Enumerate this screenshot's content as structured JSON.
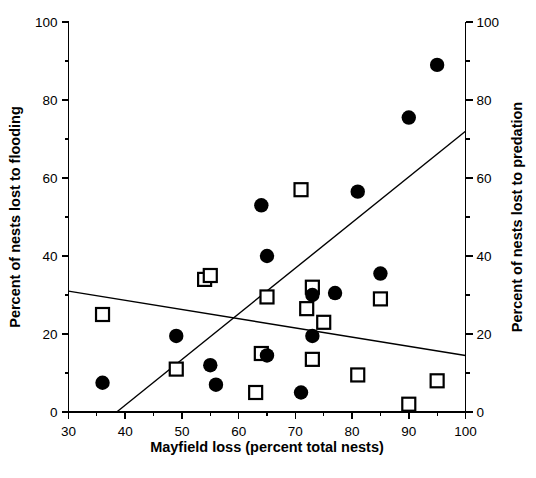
{
  "chart_data": {
    "type": "scatter",
    "title": "",
    "xlabel": "Mayfield loss (percent total nests)",
    "ylabel": "Percent of nests lost to flooding",
    "y2label": "Percent of nests lost to predation",
    "xlim": [
      30,
      100
    ],
    "ylim": [
      0,
      100
    ],
    "y2lim": [
      0,
      100
    ],
    "xticks": [
      30,
      40,
      50,
      60,
      70,
      80,
      90,
      100
    ],
    "yticks": [
      0,
      20,
      40,
      60,
      80,
      100
    ],
    "y2ticks": [
      0,
      20,
      40,
      60,
      80,
      100
    ],
    "xtick_labels": [
      "30",
      "40",
      "50",
      "60",
      "70",
      "80",
      "90",
      "100"
    ],
    "ytick_labels": [
      "0",
      "20",
      "40",
      "60",
      "80",
      "100"
    ],
    "y2tick_labels": [
      "0",
      "20",
      "40",
      "60",
      "80",
      "100"
    ],
    "minor_tick_interval_x": 5,
    "minor_tick_interval_y": 10,
    "grid": false,
    "legend": "none",
    "series": [
      {
        "name": "Percent of nests lost to predation",
        "marker": "filled-circle",
        "marker_color": "#000000",
        "axis": "right",
        "points": [
          {
            "x": 36,
            "y": 7.5
          },
          {
            "x": 49,
            "y": 19.5
          },
          {
            "x": 55,
            "y": 12
          },
          {
            "x": 56,
            "y": 7
          },
          {
            "x": 64,
            "y": 53
          },
          {
            "x": 65,
            "y": 40
          },
          {
            "x": 65,
            "y": 14.5
          },
          {
            "x": 71,
            "y": 5
          },
          {
            "x": 73,
            "y": 30
          },
          {
            "x": 73,
            "y": 19.5
          },
          {
            "x": 77,
            "y": 30.5
          },
          {
            "x": 81,
            "y": 56.5
          },
          {
            "x": 85,
            "y": 35.5
          },
          {
            "x": 90,
            "y": 75.5
          },
          {
            "x": 95,
            "y": 89
          }
        ]
      },
      {
        "name": "Percent of nests lost to flooding",
        "marker": "open-square",
        "marker_color": "#000000",
        "axis": "left",
        "points": [
          {
            "x": 36,
            "y": 25
          },
          {
            "x": 49,
            "y": 11
          },
          {
            "x": 54,
            "y": 34
          },
          {
            "x": 55,
            "y": 35
          },
          {
            "x": 63,
            "y": 5
          },
          {
            "x": 64,
            "y": 15
          },
          {
            "x": 65,
            "y": 29.5
          },
          {
            "x": 71,
            "y": 57
          },
          {
            "x": 72,
            "y": 26.5
          },
          {
            "x": 73,
            "y": 32
          },
          {
            "x": 73,
            "y": 13.5
          },
          {
            "x": 75,
            "y": 23
          },
          {
            "x": 81,
            "y": 9.5
          },
          {
            "x": 85,
            "y": 29
          },
          {
            "x": 90,
            "y": 2
          },
          {
            "x": 95,
            "y": 8
          }
        ]
      }
    ],
    "trend_lines": [
      {
        "name": "predation-regression",
        "direction": "increasing",
        "x_start": 38.5,
        "y_start": 0,
        "x_end": 100,
        "y_end": 72
      },
      {
        "name": "flooding-regression",
        "direction": "decreasing",
        "x_start": 30,
        "y_start": 31,
        "x_end": 100,
        "y_end": 14.5
      }
    ]
  },
  "axes": {
    "left_title": "Percent of nests lost to flooding",
    "right_title": "Percent of nests lost to predation",
    "bottom_title": "Mayfield loss (percent total nests)"
  }
}
